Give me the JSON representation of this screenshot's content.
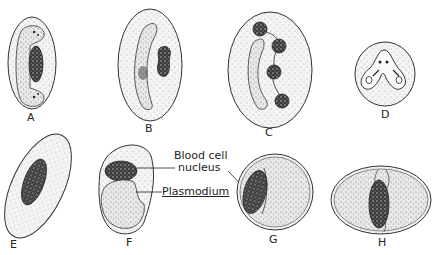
{
  "figure": {
    "panels": [
      {
        "id": "A",
        "label": "A"
      },
      {
        "id": "B",
        "label": "B"
      },
      {
        "id": "C",
        "label": "C"
      },
      {
        "id": "D",
        "label": "D"
      },
      {
        "id": "E",
        "label": "E"
      },
      {
        "id": "F",
        "label": "F"
      },
      {
        "id": "G",
        "label": "G"
      },
      {
        "id": "H",
        "label": "H"
      }
    ],
    "annotations": {
      "blood_cell_nucleus_line1": "Blood cell",
      "blood_cell_nucleus_line2": "nucleus",
      "plasmodium": "Plasmodium"
    },
    "colors": {
      "outline": "#333333",
      "stipple_fill": "#ececec",
      "nucleus_fill": "#3a3a3a"
    }
  }
}
